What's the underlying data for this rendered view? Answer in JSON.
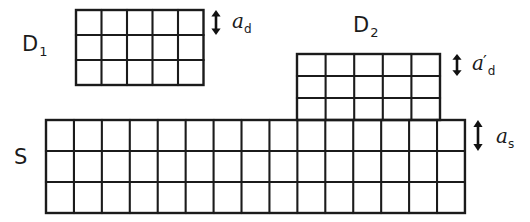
{
  "figure": {
    "type": "lattice-epitaxy-schematic",
    "background_color": "#ffffff",
    "line_color": "#1b1b1b",
    "width": 530,
    "height": 222
  },
  "regions": [
    {
      "key": "d1",
      "label_main": "D",
      "label_sub": "1",
      "description": "free-standing deposit lattice",
      "columns": 5,
      "rows": 3,
      "x": 76,
      "y": 10,
      "cell_width": 25.5,
      "cell_height": 25
    },
    {
      "key": "d2",
      "label_main": "D",
      "label_sub": "2",
      "description": "strained deposit lattice on substrate",
      "columns": 5,
      "rows": 3,
      "x": 297,
      "y": 54,
      "cell_width": 28.6,
      "cell_height": 22
    },
    {
      "key": "s",
      "label_main": "S",
      "label_sub": "",
      "description": "substrate lattice",
      "columns": 15,
      "rows": 3,
      "x": 46,
      "y": 120,
      "cell_width": 27.93,
      "cell_height": 31
    }
  ],
  "labels": {
    "d1": {
      "text": "D",
      "sub": "1",
      "x": 22,
      "y": 34
    },
    "d2": {
      "text": "D",
      "sub": "2",
      "x": 353,
      "y": 15
    },
    "s": {
      "text": "S",
      "sub": "",
      "x": 14,
      "y": 147
    }
  },
  "dimensions": [
    {
      "key": "a_d",
      "symbol": "a",
      "prime": "",
      "subscript": "d",
      "description": "deposit lattice constant, unstrained",
      "arrow_x": 216,
      "arrow_top": 10,
      "arrow_bottom": 35,
      "label_x": 232,
      "label_y": 11
    },
    {
      "key": "a_d_prime",
      "symbol": "a",
      "prime": "′",
      "subscript": "d",
      "description": "deposit lattice constant, strained",
      "arrow_x": 457,
      "arrow_top": 54,
      "arrow_bottom": 76,
      "label_x": 472,
      "label_y": 53
    },
    {
      "key": "a_s",
      "symbol": "a",
      "prime": "",
      "subscript": "s",
      "description": "substrate lattice constant",
      "arrow_x": 478,
      "arrow_top": 120,
      "arrow_bottom": 151,
      "label_x": 496,
      "label_y": 126
    }
  ]
}
